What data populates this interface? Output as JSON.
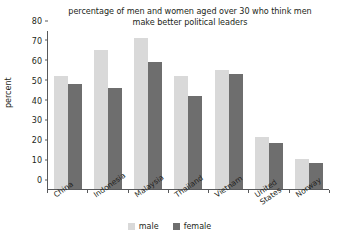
{
  "chart_data": {
    "type": "bar",
    "title": "percentage of men and women aged over 30 who think men make better political leaders",
    "title_line1": "percentage of men and women aged over 30 who think men",
    "title_line2": "make better political leaders",
    "xlabel": "",
    "ylabel": "percent",
    "ylim": [
      0,
      80
    ],
    "yticks": [
      0,
      10,
      20,
      30,
      40,
      50,
      60,
      70,
      80
    ],
    "ytick_labels": [
      "0",
      "10",
      "20",
      "30",
      "40",
      "50",
      "60",
      "70",
      "80"
    ],
    "grid": false,
    "legend_position": "bottom-center",
    "categories": [
      "China",
      "Indonesia",
      "Malaysia",
      "Thailand",
      "Vietnam",
      "United States",
      "Norway"
    ],
    "series": [
      {
        "name": "male",
        "color": "#d9d9d9",
        "values": [
          57,
          70,
          76,
          57,
          60,
          26,
          15
        ]
      },
      {
        "name": "female",
        "color": "#6e6e6e",
        "values": [
          53,
          51,
          64,
          47,
          58,
          23,
          13
        ]
      }
    ]
  },
  "legend": {
    "items": [
      {
        "label": "male",
        "color": "#d9d9d9"
      },
      {
        "label": "female",
        "color": "#6e6e6e"
      }
    ]
  },
  "axis": {
    "y_label": "percent"
  }
}
